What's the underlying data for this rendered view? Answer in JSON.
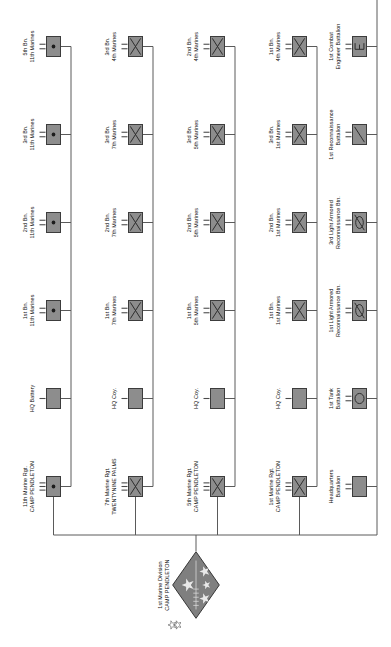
{
  "chart": {
    "type": "org-chart",
    "orientation": "rotated-90"
  },
  "division": {
    "name": "1st Marine Division",
    "location": "CAMP PENDLETON",
    "echelon": "XX",
    "symbol": "division-diamond-stars"
  },
  "regiments": [
    {
      "name": "1st Marine Rgt.",
      "location": "CAMP PENDLETON",
      "symbol": "infantry",
      "echelon": "regiment",
      "subunits": [
        {
          "line1": "HQ Coy.",
          "line2": "",
          "symbol": "plain"
        },
        {
          "line1": "1st Bn.",
          "line2": "1st Marines",
          "symbol": "infantry"
        },
        {
          "line1": "2nd Bn.",
          "line2": "1st Marines",
          "symbol": "infantry"
        },
        {
          "line1": "3rd Bn.",
          "line2": "1st Marines",
          "symbol": "infantry"
        },
        {
          "line1": "1st Bn.",
          "line2": "4th Marines",
          "symbol": "infantry"
        }
      ]
    },
    {
      "name": "5th Marine Rgt.",
      "location": "CAMP PENDLETON",
      "symbol": "infantry",
      "echelon": "regiment",
      "subunits": [
        {
          "line1": "HQ Coy.",
          "line2": "",
          "symbol": "plain"
        },
        {
          "line1": "1st Bn.",
          "line2": "5th Marines",
          "symbol": "infantry"
        },
        {
          "line1": "2nd Bn.",
          "line2": "5th Marines",
          "symbol": "infantry"
        },
        {
          "line1": "3rd Bn.",
          "line2": "5th Marines",
          "symbol": "infantry"
        },
        {
          "line1": "2nd Bn.",
          "line2": "4th Marines",
          "symbol": "infantry"
        }
      ]
    },
    {
      "name": "7th Marine Rgt.",
      "location": "TWENTYNINE PALMS",
      "symbol": "infantry",
      "echelon": "regiment",
      "subunits": [
        {
          "line1": "HQ Coy.",
          "line2": "",
          "symbol": "plain"
        },
        {
          "line1": "1st Bn.",
          "line2": "7th Marines",
          "symbol": "infantry"
        },
        {
          "line1": "2nd Bn.",
          "line2": "7th Marines",
          "symbol": "infantry"
        },
        {
          "line1": "3rd Bn.",
          "line2": "7th Marines",
          "symbol": "infantry"
        },
        {
          "line1": "3rd Bn.",
          "line2": "4th Marines",
          "symbol": "infantry"
        }
      ]
    },
    {
      "name": "11th Marine Rgt.",
      "location": "CAMP PENDLETON",
      "symbol": "artillery",
      "echelon": "regiment",
      "subunits": [
        {
          "line1": "HQ Battery",
          "line2": "",
          "symbol": "plain"
        },
        {
          "line1": "1st Bn.",
          "line2": "11th Marines",
          "symbol": "artillery"
        },
        {
          "line1": "2nd Bn.",
          "line2": "11th Marines",
          "symbol": "artillery"
        },
        {
          "line1": "3rd Bn.",
          "line2": "11th Marines",
          "symbol": "artillery"
        },
        {
          "line1": "5th Bn.",
          "line2": "11th Marines",
          "symbol": "artillery"
        }
      ]
    }
  ],
  "separate_battalions": [
    {
      "line1": "Headquarters",
      "line2": "Battalion",
      "symbol": "plain"
    },
    {
      "line1": "1st Tank",
      "line2": "Battalion",
      "symbol": "armor"
    },
    {
      "line1": "1st Light Armored",
      "line2": "Reconnaissance Btn.",
      "symbol": "lar"
    },
    {
      "line1": "3rd Light Armored",
      "line2": "Reconnaissance Btn.",
      "symbol": "lar"
    },
    {
      "line1": "1st Reconnaissance",
      "line2": "Battalion",
      "symbol": "recon"
    },
    {
      "line1": "1st Combat",
      "line2": "Engineer Battalion",
      "symbol": "engineer"
    },
    {
      "line1": "3rd Assault",
      "line2": "Amphibian Battalion",
      "symbol": "amphibian"
    }
  ],
  "colors": {
    "symbol_fill": "#8d8d8d",
    "symbol_border": "#3c3c3c",
    "line": "#5a5a5a",
    "text": "#111111",
    "background": "#ffffff"
  }
}
